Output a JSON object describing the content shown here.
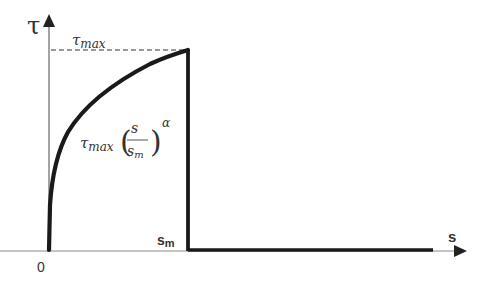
{
  "diagram": {
    "y_axis_label": "τ",
    "x_axis_label": "s",
    "origin_label": "0",
    "tau_max_label": "τ",
    "tau_max_sub": "max",
    "sm_label": "s",
    "sm_sub": "m",
    "formula": {
      "coef": "τ",
      "coef_sub": "max",
      "numerator": "s",
      "denominator": "s",
      "denominator_sub": "m",
      "exponent": "α",
      "lparen": "(",
      "rparen": ")"
    },
    "colors": {
      "curve": "#1a1a1a",
      "axis": "#555555",
      "text": "#333333"
    }
  }
}
